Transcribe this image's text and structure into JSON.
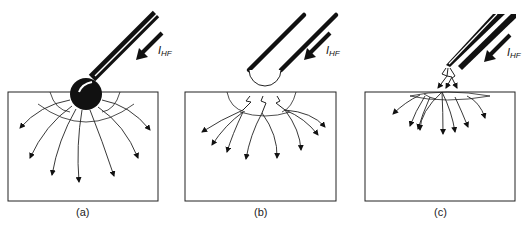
{
  "figure": {
    "current_label": "I",
    "current_subscript": "HF",
    "panels": [
      {
        "id": "a",
        "label": "(a)",
        "electrode": "ball electrode in direct contact",
        "current_paths": "smooth radial arrows"
      },
      {
        "id": "b",
        "label": "(b)",
        "electrode": "hollow rounded tip touching surface",
        "current_paths": "sparks then branching arrows"
      },
      {
        "id": "c",
        "label": "(c)",
        "electrode": "needle tip above surface",
        "current_paths": "sparks across air gap then shallow arrows"
      }
    ]
  }
}
